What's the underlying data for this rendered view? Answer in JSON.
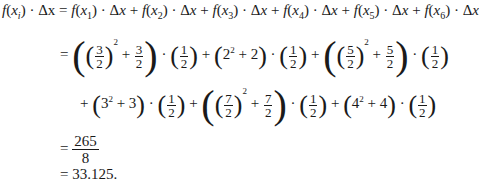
{
  "lines": [
    {
      "id": "line1",
      "lhs": "f(xᵢ) · Δx",
      "rhs": "= f(x₁) · Δx + f(x₂) · Δx + f(x₃) · Δx + f(x₄) · Δx + f(x₅) · Δx + f(x₆) · Δx"
    },
    {
      "id": "line2",
      "text": "= ((3/2)² + 3/2) · (1/2) + (2² + 2) · (1/2) + ((5/2)² + 5/2) · (1/2)"
    },
    {
      "id": "line3",
      "text": "+ (3² + 3) · (1/2) + ((7/2)² + 7/2) · (1/2) + (4² + 4) · (1/2)"
    },
    {
      "id": "line4",
      "numerator": "265",
      "denominator": "8"
    },
    {
      "id": "line5",
      "text": "= 33.125."
    }
  ],
  "symbols": {
    "eq": "=",
    "plus": "+",
    "dot": "·",
    "delta_x": "Δx",
    "half_num": "1",
    "half_den": "2"
  },
  "terms": {
    "f": "f",
    "x": "x",
    "i": "i",
    "subs": [
      "1",
      "2",
      "3",
      "4",
      "5",
      "6"
    ],
    "a_num": "3",
    "a_den": "2",
    "b_base": "2",
    "c_num": "5",
    "c_den": "2",
    "d_base": "3",
    "e_num": "7",
    "e_den": "2",
    "g_base": "4",
    "sq": "2"
  },
  "result": {
    "fraction_num": "265",
    "fraction_den": "8",
    "decimal": "33.125."
  }
}
